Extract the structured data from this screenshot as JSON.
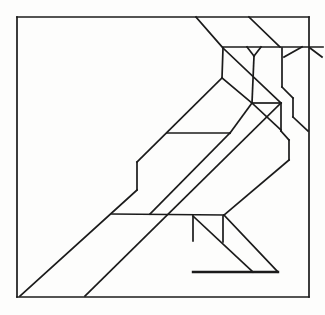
{
  "figure": {
    "background_color": "#fdfdfc",
    "stroke_color": "#1b1b1b",
    "default_stroke_width": 1.7,
    "canvas": {
      "width": 325,
      "height": 315
    },
    "segments": [
      {
        "name": "frame-top",
        "x1": 17,
        "y1": 17,
        "x2": 309,
        "y2": 17
      },
      {
        "name": "frame-right",
        "x1": 309,
        "y1": 17,
        "x2": 309,
        "y2": 297
      },
      {
        "name": "frame-bottom",
        "x1": 17,
        "y1": 297,
        "x2": 309,
        "y2": 297
      },
      {
        "name": "frame-left",
        "x1": 17,
        "y1": 17,
        "x2": 17,
        "y2": 297
      },
      {
        "name": "crown-diagonal-left",
        "x1": 196,
        "y1": 17,
        "x2": 223,
        "y2": 48
      },
      {
        "name": "crown-diagonal-right",
        "x1": 249,
        "y1": 17,
        "x2": 280,
        "y2": 47
      },
      {
        "name": "head-top-horizontal",
        "x1": 223,
        "y1": 47,
        "x2": 323,
        "y2": 47
      },
      {
        "name": "eye-notch-left",
        "x1": 247,
        "y1": 47,
        "x2": 254,
        "y2": 56
      },
      {
        "name": "eye-notch-right",
        "x1": 261,
        "y1": 47,
        "x2": 254,
        "y2": 56
      },
      {
        "name": "eye-stem-vertical",
        "x1": 254,
        "y1": 56,
        "x2": 252,
        "y2": 103
      },
      {
        "name": "face-front-vertical",
        "x1": 223,
        "y1": 48,
        "x2": 222,
        "y2": 78
      },
      {
        "name": "head-cheek-diagonal",
        "x1": 223,
        "y1": 48,
        "x2": 281,
        "y2": 103
      },
      {
        "name": "beak-underside-diagonal",
        "x1": 284,
        "y1": 57,
        "x2": 302,
        "y2": 47
      },
      {
        "name": "beak-tip-diagonal",
        "x1": 310,
        "y1": 48,
        "x2": 322,
        "y2": 57
      },
      {
        "name": "nape-vertical-upper",
        "x1": 282,
        "y1": 48,
        "x2": 282,
        "y2": 87
      },
      {
        "name": "nape-jog-diagonal",
        "x1": 282,
        "y1": 87,
        "x2": 293,
        "y2": 98
      },
      {
        "name": "nape-vertical-lower",
        "x1": 293,
        "y1": 98,
        "x2": 293,
        "y2": 117
      },
      {
        "name": "nape-to-border-diagonal",
        "x1": 293,
        "y1": 117,
        "x2": 308,
        "y2": 131
      },
      {
        "name": "throat-horizontal",
        "x1": 252,
        "y1": 103,
        "x2": 281,
        "y2": 103
      },
      {
        "name": "throat-triangle-diagonal",
        "x1": 252,
        "y1": 103,
        "x2": 281,
        "y2": 130
      },
      {
        "name": "back-vertical-upper",
        "x1": 281,
        "y1": 103,
        "x2": 281,
        "y2": 131
      },
      {
        "name": "back-jog-diagonal",
        "x1": 281,
        "y1": 131,
        "x2": 289,
        "y2": 140
      },
      {
        "name": "back-vertical-lower",
        "x1": 289,
        "y1": 140,
        "x2": 289,
        "y2": 160
      },
      {
        "name": "back-to-leg-diagonal",
        "x1": 289,
        "y1": 160,
        "x2": 224,
        "y2": 215
      },
      {
        "name": "neck-front-diagonal",
        "x1": 222,
        "y1": 78,
        "x2": 252,
        "y2": 103
      },
      {
        "name": "back-ridge-diagonal",
        "x1": 222,
        "y1": 78,
        "x2": 137,
        "y2": 162
      },
      {
        "name": "wing-front-vertical",
        "x1": 137,
        "y1": 162,
        "x2": 137,
        "y2": 190
      },
      {
        "name": "wing-lower-diagonal",
        "x1": 137,
        "y1": 190,
        "x2": 20,
        "y2": 296
      },
      {
        "name": "wing-top-horizontal",
        "x1": 167,
        "y1": 133,
        "x2": 230,
        "y2": 133
      },
      {
        "name": "chest-diagonal",
        "x1": 252,
        "y1": 103,
        "x2": 230,
        "y2": 133
      },
      {
        "name": "wing-trailing-diagonal",
        "x1": 230,
        "y1": 133,
        "x2": 150,
        "y2": 214
      },
      {
        "name": "belly-diagonal",
        "x1": 281,
        "y1": 103,
        "x2": 85,
        "y2": 296
      },
      {
        "name": "hip-horizontal",
        "x1": 112,
        "y1": 214,
        "x2": 224,
        "y2": 215
      },
      {
        "name": "leg-left-vertical",
        "x1": 193,
        "y1": 216,
        "x2": 193,
        "y2": 241
      },
      {
        "name": "leg-inner-vertical",
        "x1": 223,
        "y1": 216,
        "x2": 223,
        "y2": 242
      },
      {
        "name": "leg-front-diagonal",
        "x1": 193,
        "y1": 216,
        "x2": 253,
        "y2": 272
      },
      {
        "name": "leg-back-diagonal",
        "x1": 224,
        "y1": 215,
        "x2": 278,
        "y2": 272
      },
      {
        "name": "branch-horizontal",
        "x1": 193,
        "y1": 272,
        "x2": 278,
        "y2": 272,
        "w": 2.4
      }
    ]
  }
}
